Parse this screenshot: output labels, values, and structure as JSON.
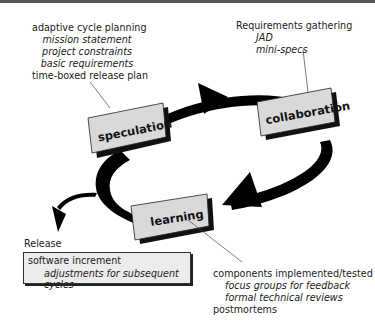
{
  "diagram": {
    "phases": [
      {
        "id": "speculation",
        "label": "speculation"
      },
      {
        "id": "collaboration",
        "label": "collaboration"
      },
      {
        "id": "learning",
        "label": "learning"
      }
    ],
    "notes": {
      "speculation": {
        "heading": "adaptive cycle planning",
        "items": [
          "mission statement",
          "project constraints",
          "basic requirements"
        ],
        "footer": "time-boxed release plan"
      },
      "collaboration": {
        "heading": "Requirements gathering",
        "items": [
          "JAD",
          "mini-specs"
        ]
      },
      "learning": {
        "heading": "components implemented/tested",
        "items": [
          "focus groups for feedback",
          "formal technical reviews"
        ],
        "footer": "postmortems"
      },
      "release": {
        "heading": "Release",
        "line1": "software increment",
        "line2": "adjustments for subsequent cycles"
      }
    },
    "colors": {
      "arrow": "#000000",
      "box_fill": "#d9d9d9",
      "box_shadow": "#111111",
      "top_rule": "#555555"
    }
  }
}
